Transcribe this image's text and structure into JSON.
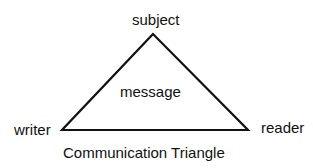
{
  "diagram": {
    "type": "triangle",
    "vertices": {
      "top": "subject",
      "left": "writer",
      "right": "reader"
    },
    "center_label": "message",
    "caption": "Communication Triangle"
  }
}
